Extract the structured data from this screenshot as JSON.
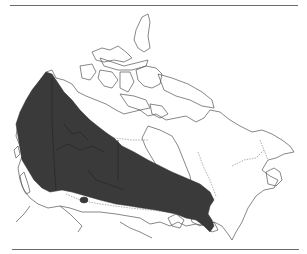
{
  "map": {
    "title": "",
    "region": "Canada",
    "legend": [],
    "colors": {
      "background": "#ffffff",
      "range_fill": "#3a3a3a",
      "outline": "#555555",
      "rule": "#6a6a6a"
    },
    "features": {
      "range_area": "distribution-range",
      "isolated_patch": "outlier-population"
    }
  }
}
